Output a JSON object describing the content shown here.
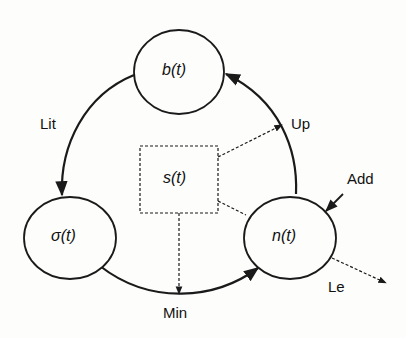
{
  "nodes": {
    "b": {
      "label": "b(t)"
    },
    "sigma": {
      "label": "σ(t)"
    },
    "n": {
      "label": "n(t)"
    },
    "s": {
      "label": "s(t)"
    }
  },
  "edges": {
    "lit": {
      "label": "Lit",
      "from": "b(t)",
      "to": "σ(t)",
      "style": "solid"
    },
    "min": {
      "label": "Min",
      "from": "σ(t)",
      "to": "n(t)",
      "style": "solid"
    },
    "up": {
      "label": "Up",
      "from": "n(t)",
      "to": "b(t)",
      "style": "solid"
    },
    "add": {
      "label": "Add",
      "to": "n(t)",
      "style": "solid"
    },
    "le": {
      "label": "Le",
      "from": "n(t)",
      "style": "dashed"
    }
  },
  "colors": {
    "stroke": "#1a1a1a",
    "background": "#fdfdfc"
  }
}
